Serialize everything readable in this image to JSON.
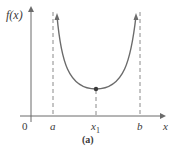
{
  "figure": {
    "caption": "(a)",
    "y_axis_label": "f(x)",
    "x_axis_label": "x",
    "origin_label": "0",
    "ticks": [
      {
        "label": "a",
        "x": 53
      },
      {
        "label": "x",
        "sub": "1",
        "x": 96
      },
      {
        "label": "b",
        "x": 140
      }
    ],
    "curve": {
      "description": "U-shaped curve with vertical asymptotes at x=a and x=b, minimum at x1",
      "min_point": {
        "label": "x1"
      },
      "color": "#6b6b6b"
    },
    "colors": {
      "axis": "#6b6b6b",
      "dashed": "#8a8a8a",
      "point": "#3a3a3a",
      "text": "#3a3a3a"
    }
  }
}
